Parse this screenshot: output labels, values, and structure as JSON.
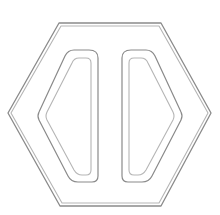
{
  "figure": {
    "colors": {
      "background": "#ffffff",
      "line": "#8a8a8a",
      "line_light": "#b5b5b5"
    },
    "shapes": [
      {
        "name": "outer-hexagon-outer",
        "points": "59,23 161,23 211,113 161,206 60,206 8,113"
      },
      {
        "name": "outer-hexagon-inner",
        "points": "61,26 159,26 208,113 159,203 62,203 11,113"
      },
      {
        "name": "left-shape-outer",
        "d": "M 89 50 L 74 50 Q 68 50 65 56 L 39 112 Q 37 116 39 120 L 68 176 Q 71 182 78 182 L 92 182 Q 98 182 98 176 L 98 58 Q 98 50 89 50 Z"
      },
      {
        "name": "left-shape-inner",
        "d": "M 86 58 L 79 58 Q 74 58 72 63 L 47 112 Q 45 116 47 120 L 74 170 Q 77 175 82 175 L 86 175 Q 91 175 91 170 L 91 63 Q 91 58 86 58 Z"
      },
      {
        "name": "right-shape-outer",
        "d": "M 131 50 L 146 50 Q 152 50 155 56 L 181 112 Q 183 116 181 120 L 152 176 Q 149 182 142 182 L 128 182 Q 122 182 122 176 L 122 58 Q 122 50 131 50 Z"
      },
      {
        "name": "right-shape-inner",
        "d": "M 134 58 L 141 58 Q 146 58 148 63 L 173 112 Q 175 116 173 120 L 146 170 Q 143 175 138 175 L 134 175 Q 129 175 129 170 L 129 63 Q 129 58 134 58 Z"
      }
    ]
  }
}
